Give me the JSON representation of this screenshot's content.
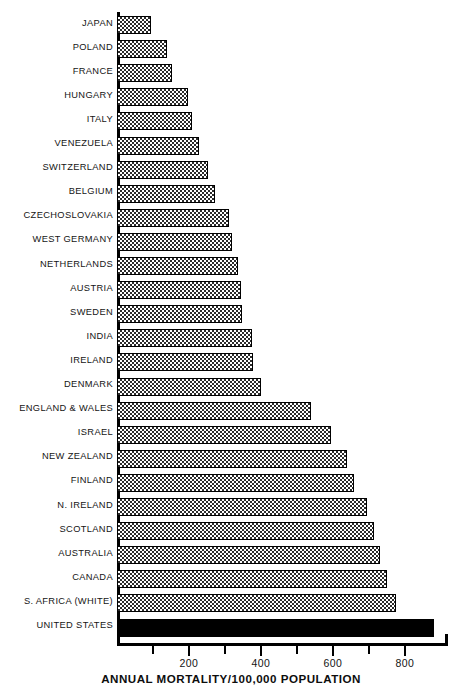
{
  "chart_data": {
    "type": "bar",
    "orientation": "horizontal",
    "title": "",
    "xlabel": "ANNUAL MORTALITY/100,000 POPULATION",
    "ylabel": "",
    "xlim": [
      0,
      920
    ],
    "grid": false,
    "legend": null,
    "xticks_major": [
      200,
      400,
      600,
      800
    ],
    "xticks_minor": [
      100,
      300,
      500,
      700
    ],
    "xticklabels": [
      "200",
      "400",
      "600",
      "800"
    ],
    "categories": [
      "JAPAN",
      "POLAND",
      "FRANCE",
      "HUNGARY",
      "ITALY",
      "VENEZUELA",
      "SWITZERLAND",
      "BELGIUM",
      "CZECHOSLOVAKIA",
      "WEST GERMANY",
      "NETHERLANDS",
      "AUSTRIA",
      "SWEDEN",
      "INDIA",
      "IRELAND",
      "DENMARK",
      "ENGLAND & WALES",
      "ISRAEL",
      "NEW ZEALAND",
      "FINLAND",
      "N. IRELAND",
      "SCOTLAND",
      "AUSTRALIA",
      "CANADA",
      "S. AFRICA (WHITE)",
      "UNITED STATES"
    ],
    "values": [
      95,
      140,
      152,
      198,
      208,
      228,
      252,
      272,
      310,
      320,
      335,
      345,
      348,
      375,
      378,
      400,
      540,
      595,
      640,
      660,
      695,
      715,
      730,
      750,
      775,
      880
    ],
    "bar_styles": [
      "hatch",
      "hatch",
      "hatch",
      "hatch",
      "hatch",
      "hatch",
      "hatch",
      "hatch",
      "hatch",
      "hatch",
      "hatch",
      "hatch",
      "hatch",
      "hatch",
      "hatch",
      "hatch",
      "hatch",
      "hatch",
      "hatch",
      "hatch",
      "hatch",
      "hatch",
      "hatch",
      "hatch",
      "hatch",
      "solid"
    ],
    "colors": {
      "bar_fill_hatch": "#2b2b2b",
      "bar_fill_solid": "#000000",
      "bar_edge": "#000000",
      "axis": "#000000",
      "text": "#141414",
      "background": "#ffffff"
    }
  }
}
